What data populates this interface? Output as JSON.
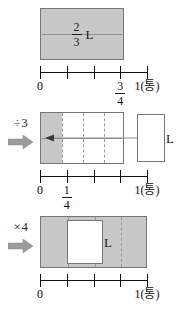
{
  "figure": {
    "title_text": "",
    "colors": {
      "fill_gray": "#c8c8c8",
      "stroke": "#767676",
      "axis": "#111111",
      "arrow_gray": "#9b9b9b",
      "dashed": "#9a9a9a"
    }
  },
  "panels": [
    {
      "id": "panel-top",
      "operator": {
        "label": "",
        "arrow": ""
      },
      "bar": {
        "label_numerator": "2",
        "label_denominator": "3",
        "label_unit": "L",
        "fill": "gray"
      },
      "numberline": {
        "ticks": 5,
        "labels": [
          {
            "at": 0,
            "text": "0",
            "type": "plain"
          },
          {
            "at": 3,
            "numerator": "3",
            "denominator": "4",
            "type": "fraction"
          },
          {
            "at": 4,
            "text": "1(통)",
            "type": "plain"
          }
        ]
      }
    },
    {
      "id": "panel-middle",
      "operator": {
        "label": "÷3",
        "arrow": "right-arrow"
      },
      "bar": {
        "segments": 4,
        "filled_segments": 1,
        "label_unit": "L",
        "fill": "partial"
      },
      "side_box": {
        "label_unit": "L"
      },
      "numberline": {
        "ticks": 5,
        "labels": [
          {
            "at": 0,
            "text": "0",
            "type": "plain"
          },
          {
            "at": 1,
            "numerator": "1",
            "denominator": "4",
            "type": "fraction"
          },
          {
            "at": 4,
            "text": "1(통)",
            "type": "plain"
          }
        ]
      }
    },
    {
      "id": "panel-bottom",
      "operator": {
        "label": "×4",
        "arrow": "right-arrow"
      },
      "bar": {
        "segments": 4,
        "filled_segments": 4,
        "label_unit": "L",
        "fill": "gray"
      },
      "inner_box": {
        "label_unit": "L"
      },
      "numberline": {
        "ticks": 5,
        "labels": [
          {
            "at": 0,
            "text": "0",
            "type": "plain"
          },
          {
            "at": 4,
            "text": "1(통)",
            "type": "plain"
          }
        ]
      }
    }
  ]
}
